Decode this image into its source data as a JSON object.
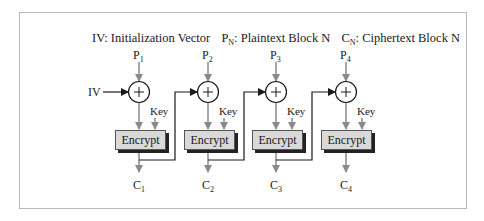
{
  "legend": {
    "iv": "IV: Initialization Vector",
    "pn_prefix": "P",
    "pn_sub": "N",
    "pn_text": ": Plaintext Block N",
    "cn_prefix": "C",
    "cn_sub": "N",
    "cn_text": ": Ciphertext Block N"
  },
  "iv_input": "IV",
  "blocks": [
    {
      "p": "P",
      "p_sub": "1",
      "key": "Key",
      "encrypt": "Encrypt",
      "c": "C",
      "c_sub": "1"
    },
    {
      "p": "P",
      "p_sub": "2",
      "key": "Key",
      "encrypt": "Encrypt",
      "c": "C",
      "c_sub": "2"
    },
    {
      "p": "P",
      "p_sub": "3",
      "key": "Key",
      "encrypt": "Encrypt",
      "c": "C",
      "c_sub": "3"
    },
    {
      "p": "P",
      "p_sub": "4",
      "key": "Key",
      "encrypt": "Encrypt",
      "c": "C",
      "c_sub": "4"
    }
  ],
  "colors": {
    "arrow_gray": "#8a8a8a",
    "line_black": "#1a1a1a",
    "box_fill": "#d9d9d9",
    "frame": "#b8b8b8"
  }
}
